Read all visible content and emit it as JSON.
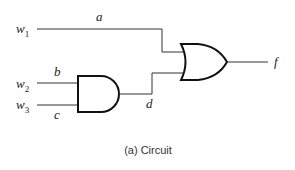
{
  "figure": {
    "caption": "(a) Circuit",
    "inputs": [
      {
        "name": "w",
        "sub": "1"
      },
      {
        "name": "w",
        "sub": "2"
      },
      {
        "name": "w",
        "sub": "3"
      }
    ],
    "signals": {
      "a": "a",
      "b": "b",
      "c": "c",
      "d": "d",
      "f": "f"
    },
    "gates": [
      {
        "type": "AND",
        "inputs": [
          "b",
          "c"
        ],
        "output": "d"
      },
      {
        "type": "OR",
        "inputs": [
          "a",
          "d"
        ],
        "output": "f"
      }
    ]
  }
}
